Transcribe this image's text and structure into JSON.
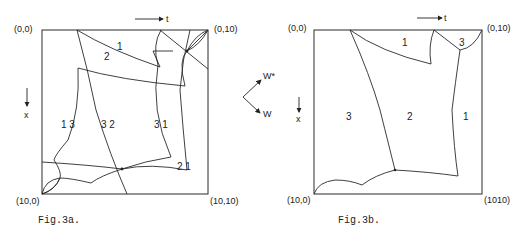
{
  "fig3a": {
    "caption": "Fig.3a.",
    "corners": {
      "top_left": "(0,0)",
      "top_right": "(0,10)",
      "bottom_left": "(10,0)",
      "bottom_right": "(10,10)"
    },
    "axis_t": "t",
    "axis_x": "x",
    "region_labels": {
      "a": "1",
      "b": "2",
      "c": "1 3",
      "d": "3 2",
      "e": "3 1",
      "f": "2 1"
    }
  },
  "fig3b": {
    "caption": "Fig.3b.",
    "corners": {
      "top_left": "(0,0)",
      "top_right": "(0,10)",
      "bottom_left": "(10,0)",
      "bottom_right": "(1010)"
    },
    "axis_t": "t",
    "axis_x": "x",
    "region_labels": {
      "top1": "1",
      "top3": "3",
      "left3": "3",
      "mid2": "2",
      "right1": "1"
    }
  },
  "legend": {
    "w_star": "W*",
    "w": "W"
  }
}
